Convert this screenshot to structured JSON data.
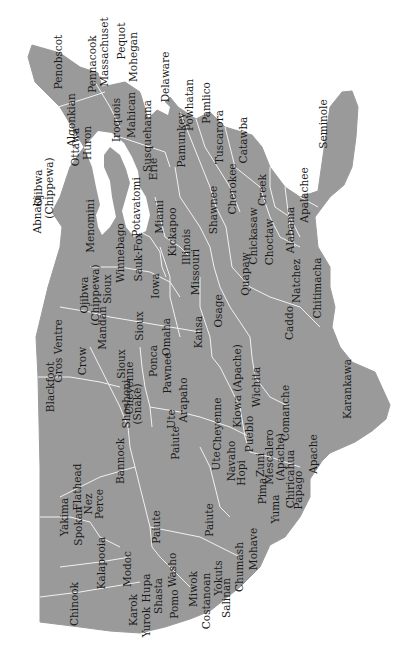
{
  "map": {
    "title": "Native American tribal regions of the contiguous United States",
    "orientation": "rotated 90° counter-clockwise (north to the left)",
    "colors": {
      "land": "#9a9a9a",
      "border": "#f2f2f2",
      "water": "#ffffff",
      "text": "#1a1a1a"
    },
    "tribes": [
      {
        "id": "abnaki",
        "label": "Abnaki",
        "x": 452,
        "y": 37
      },
      {
        "id": "penobscot",
        "label": "Penobscot",
        "x": 605,
        "y": 58
      },
      {
        "id": "pennacook",
        "label": "Pennacook",
        "x": 603,
        "y": 92
      },
      {
        "id": "massachuset",
        "label": "Massachuset",
        "x": 615,
        "y": 104
      },
      {
        "id": "pequot",
        "label": "Pequot",
        "x": 626,
        "y": 121
      },
      {
        "id": "mohegan",
        "label": "Mohegan",
        "x": 610,
        "y": 133
      },
      {
        "id": "delaware",
        "label": "Delaware",
        "x": 590,
        "y": 165
      },
      {
        "id": "algonkian",
        "label": "Algonkian",
        "x": 547,
        "y": 71
      },
      {
        "id": "huron",
        "label": "Huron",
        "x": 524,
        "y": 87
      },
      {
        "id": "iroquois",
        "label": "Iroquois",
        "x": 547,
        "y": 116
      },
      {
        "id": "mahican",
        "label": "Mahican",
        "x": 552,
        "y": 131
      },
      {
        "id": "susquehanna",
        "label": "Susquehanna",
        "x": 531,
        "y": 147
      },
      {
        "id": "pamunkey",
        "label": "Pamunkey",
        "x": 527,
        "y": 181
      },
      {
        "id": "powhatan",
        "label": "Powhatan",
        "x": 562,
        "y": 189
      },
      {
        "id": "pamlico",
        "label": "Pamlico",
        "x": 564,
        "y": 206
      },
      {
        "id": "tuscarora",
        "label": "Tuscarora",
        "x": 530,
        "y": 219
      },
      {
        "id": "catawba",
        "label": "Catawba",
        "x": 527,
        "y": 243
      },
      {
        "id": "seminole",
        "label": "Seminole",
        "x": 543,
        "y": 323
      },
      {
        "id": "apalachee",
        "label": "Apalachee",
        "x": 472,
        "y": 304
      },
      {
        "id": "cherokee",
        "label": "Cherokee",
        "x": 478,
        "y": 232
      },
      {
        "id": "creek",
        "label": "Creek",
        "x": 477,
        "y": 262
      },
      {
        "id": "alabama",
        "label": "Alabama",
        "x": 437,
        "y": 290
      },
      {
        "id": "chickasaw",
        "label": "Chickasaw",
        "x": 431,
        "y": 253
      },
      {
        "id": "choctaw",
        "label": "Choctaw",
        "x": 425,
        "y": 269
      },
      {
        "id": "natchez",
        "label": "Natchez",
        "x": 386,
        "y": 296
      },
      {
        "id": "chitimacha",
        "label": "Chitimacha",
        "x": 379,
        "y": 317
      },
      {
        "id": "shawnee",
        "label": "Shawnee",
        "x": 457,
        "y": 213
      },
      {
        "id": "erie",
        "label": "Erie",
        "x": 498,
        "y": 153
      },
      {
        "id": "potavatomi",
        "label": "Potavatomi",
        "x": 460,
        "y": 136
      },
      {
        "id": "miami",
        "label": "Miami",
        "x": 450,
        "y": 159
      },
      {
        "id": "kickapoo",
        "label": "Kickapoo",
        "x": 435,
        "y": 172
      },
      {
        "id": "illinois",
        "label": "Illinois",
        "x": 420,
        "y": 186
      },
      {
        "id": "menomini",
        "label": "Menomini",
        "x": 441,
        "y": 90
      },
      {
        "id": "ottawa",
        "label": "Ottawa",
        "x": 520,
        "y": 75
      },
      {
        "id": "ojibwa_chippewa_north",
        "label": "Ojibwa\n(Chippewa)",
        "x": 479,
        "y": 44
      },
      {
        "id": "winnebago",
        "label": "Winnebago",
        "x": 414,
        "y": 120
      },
      {
        "id": "sauk_fox",
        "label": "Sauk-Fox",
        "x": 410,
        "y": 138
      },
      {
        "id": "iowa",
        "label": "Iowa",
        "x": 381,
        "y": 155
      },
      {
        "id": "missouri",
        "label": "Missouri",
        "x": 395,
        "y": 195
      },
      {
        "id": "quapaw",
        "label": "Quapaw",
        "x": 393,
        "y": 245
      },
      {
        "id": "caddo",
        "label": "Caddo",
        "x": 344,
        "y": 289
      },
      {
        "id": "ojibwa_chippewa_west",
        "label": "Ojibwa\n(Chippewa)",
        "x": 372,
        "y": 90
      },
      {
        "id": "sioux_east",
        "label": "Sioux",
        "x": 378,
        "y": 107
      },
      {
        "id": "sioux_mid",
        "label": "Sioux",
        "x": 341,
        "y": 139
      },
      {
        "id": "omaha",
        "label": "Omaha",
        "x": 330,
        "y": 166
      },
      {
        "id": "kansa",
        "label": "Kansa",
        "x": 335,
        "y": 198
      },
      {
        "id": "osage",
        "label": "Osage",
        "x": 356,
        "y": 218
      },
      {
        "id": "mandan",
        "label": "Mandan",
        "x": 339,
        "y": 102
      },
      {
        "id": "ponca",
        "label": "Ponca",
        "x": 306,
        "y": 153
      },
      {
        "id": "pawnee",
        "label": "Pawnee",
        "x": 294,
        "y": 167
      },
      {
        "id": "wichita",
        "label": "Wichita",
        "x": 280,
        "y": 256
      },
      {
        "id": "kiowa_apache",
        "label": "Kiowa (Apache)",
        "x": 281,
        "y": 237
      },
      {
        "id": "comanche",
        "label": "Comanche",
        "x": 254,
        "y": 285
      },
      {
        "id": "karankawa",
        "label": "Karankawa",
        "x": 278,
        "y": 347
      },
      {
        "id": "apache",
        "label": "Apache",
        "x": 213,
        "y": 313
      },
      {
        "id": "arapaho",
        "label": "Arapaho",
        "x": 267,
        "y": 183
      },
      {
        "id": "cheyenne_south",
        "label": "Cheyenne",
        "x": 243,
        "y": 217
      },
      {
        "id": "cheyenne_north",
        "label": "Cheyenne",
        "x": 279,
        "y": 129
      },
      {
        "id": "sioux_west",
        "label": "Sioux",
        "x": 303,
        "y": 121
      },
      {
        "id": "crow",
        "label": "Crow",
        "x": 306,
        "y": 82
      },
      {
        "id": "gros_ventre",
        "label": "Gros Ventre",
        "x": 316,
        "y": 58
      },
      {
        "id": "blackfoot",
        "label": "Blackfoot",
        "x": 280,
        "y": 50
      },
      {
        "id": "shoshoni_snake",
        "label": "Shoshoni\n(Snake)",
        "x": 263,
        "y": 132
      },
      {
        "id": "ute_north",
        "label": "Ute",
        "x": 248,
        "y": 171
      },
      {
        "id": "ute_south",
        "label": "Ute",
        "x": 206,
        "y": 216
      },
      {
        "id": "pueblo",
        "label": "Pueblo",
        "x": 233,
        "y": 249
      },
      {
        "id": "mescalero_apache",
        "label": "Mescalero\n(Apache)",
        "x": 210,
        "y": 275
      },
      {
        "id": "navaho",
        "label": "Navaho",
        "x": 206,
        "y": 231
      },
      {
        "id": "hopi",
        "label": "Hopi",
        "x": 194,
        "y": 241
      },
      {
        "id": "zuni",
        "label": "Zuni",
        "x": 202,
        "y": 260
      },
      {
        "id": "chiricahua",
        "label": "Chiricahua",
        "x": 188,
        "y": 290
      },
      {
        "id": "papago",
        "label": "Papago",
        "x": 177,
        "y": 298
      },
      {
        "id": "pima",
        "label": "Pima",
        "x": 176,
        "y": 262
      },
      {
        "id": "yuma",
        "label": "Yuma",
        "x": 158,
        "y": 275
      },
      {
        "id": "flathead",
        "label": "Flathead",
        "x": 180,
        "y": 77
      },
      {
        "id": "nez_perce",
        "label": "Nez\nPerce",
        "x": 163,
        "y": 94
      },
      {
        "id": "bannock",
        "label": "Bannock",
        "x": 206,
        "y": 120
      },
      {
        "id": "paiute_north",
        "label": "Paiute",
        "x": 224,
        "y": 175
      },
      {
        "id": "paiute_mid",
        "label": "Paiute",
        "x": 140,
        "y": 156
      },
      {
        "id": "paiute_south",
        "label": "Paiute",
        "x": 147,
        "y": 209
      },
      {
        "id": "yakima",
        "label": "Yakima",
        "x": 150,
        "y": 64
      },
      {
        "id": "spokan",
        "label": "Spokan",
        "x": 141,
        "y": 78
      },
      {
        "id": "kalapooia",
        "label": "Kalapooia",
        "x": 104,
        "y": 101
      },
      {
        "id": "modoc",
        "label": "Modoc",
        "x": 98,
        "y": 127
      },
      {
        "id": "chinook",
        "label": "Chinook",
        "x": 63,
        "y": 74
      },
      {
        "id": "washo",
        "label": "Washo",
        "x": 97,
        "y": 172
      },
      {
        "id": "hupa",
        "label": "Hupa",
        "x": 79,
        "y": 146
      },
      {
        "id": "shasta",
        "label": "Shasta",
        "x": 71,
        "y": 158
      },
      {
        "id": "pomo",
        "label": "Pomo",
        "x": 63,
        "y": 174
      },
      {
        "id": "karok",
        "label": "Karok",
        "x": 57,
        "y": 133
      },
      {
        "id": "yurok",
        "label": "Yurok",
        "x": 45,
        "y": 146
      },
      {
        "id": "miwok",
        "label": "Miwok",
        "x": 78,
        "y": 193
      },
      {
        "id": "costanoan",
        "label": "Costanoan",
        "x": 66,
        "y": 206
      },
      {
        "id": "yokuts",
        "label": "Yokuts",
        "x": 89,
        "y": 218
      },
      {
        "id": "salinan",
        "label": "Salinan",
        "x": 69,
        "y": 226
      },
      {
        "id": "chumash",
        "label": "Chumash",
        "x": 100,
        "y": 239
      },
      {
        "id": "mohave",
        "label": "Mohave",
        "x": 118,
        "y": 253
      }
    ]
  }
}
